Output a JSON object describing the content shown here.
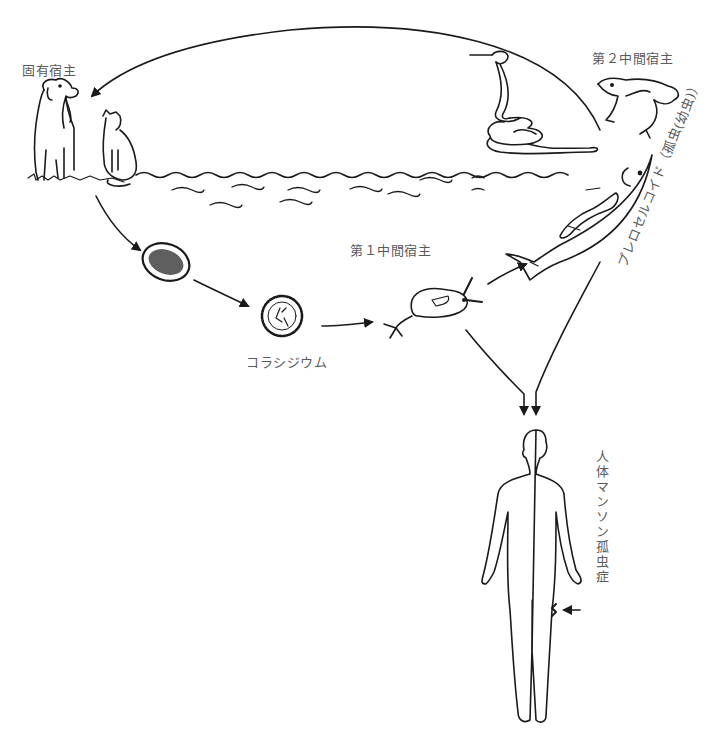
{
  "labels": {
    "definitive_host": "固有宿主",
    "second_intermediate_host": "第２中間宿主",
    "first_intermediate_host": "第１中間宿主",
    "coracidium": "コラシジウム",
    "plerocercoid": "プレロセルコイド（孤虫(幼虫)）",
    "human_disease": "人体マンソン孤虫症"
  },
  "stages": [
    {
      "id": "definitive-host",
      "depicts": [
        "dog",
        "cat"
      ]
    },
    {
      "id": "egg",
      "depicts": [
        "egg"
      ]
    },
    {
      "id": "coracidium",
      "depicts": [
        "coracidium"
      ]
    },
    {
      "id": "first-intermediate-host",
      "depicts": [
        "copepod"
      ]
    },
    {
      "id": "second-intermediate-host",
      "depicts": [
        "snake",
        "frog",
        "fish"
      ]
    },
    {
      "id": "human",
      "depicts": [
        "human body with lesion"
      ]
    }
  ],
  "colors": {
    "line": "#1a1a1a",
    "text": "#5a5a5a",
    "background": "#ffffff"
  }
}
